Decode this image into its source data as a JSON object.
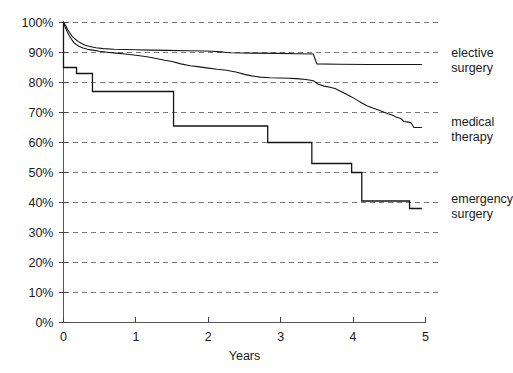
{
  "chart_data": {
    "type": "line",
    "title": "",
    "subtitle": "",
    "xlabel": "Years",
    "ylabel": "",
    "xlim": [
      0,
      5
    ],
    "ylim": [
      0,
      1.0
    ],
    "grid": true,
    "grid_axis": "y",
    "legend_position": "right-inline",
    "x_ticks": [
      "0",
      "1",
      "2",
      "3",
      "4",
      "5"
    ],
    "x_tick_values": [
      0,
      1,
      2,
      3,
      4,
      5
    ],
    "y_ticks": [
      "0%",
      "10%",
      "20%",
      "30%",
      "40%",
      "50%",
      "60%",
      "70%",
      "80%",
      "90%",
      "100%"
    ],
    "y_tick_values": [
      0,
      10,
      20,
      30,
      40,
      50,
      60,
      70,
      80,
      90,
      100
    ],
    "curve_style": "kaplan-meier step / survival",
    "series": [
      {
        "name": "elective surgery",
        "label_line1": "elective",
        "label_line2": "surgery",
        "color": "#151515",
        "label_x": 5.08,
        "label_y_pct": 88.5,
        "final_value_pct": 86,
        "points": [
          [
            0.0,
            100.0
          ],
          [
            0.03,
            99.0
          ],
          [
            0.06,
            97.6
          ],
          [
            0.09,
            96.4
          ],
          [
            0.12,
            95.4
          ],
          [
            0.16,
            94.5
          ],
          [
            0.2,
            93.7
          ],
          [
            0.25,
            93.0
          ],
          [
            0.3,
            92.4
          ],
          [
            0.36,
            92.0
          ],
          [
            0.45,
            91.6
          ],
          [
            0.55,
            91.3
          ],
          [
            0.7,
            91.1
          ],
          [
            0.85,
            91.0
          ],
          [
            1.0,
            90.9
          ],
          [
            1.2,
            90.8
          ],
          [
            1.45,
            90.7
          ],
          [
            1.7,
            90.6
          ],
          [
            1.95,
            90.5
          ],
          [
            2.05,
            90.4
          ],
          [
            2.12,
            90.3
          ],
          [
            2.18,
            90.2
          ],
          [
            2.22,
            90.1
          ],
          [
            2.25,
            90.0
          ],
          [
            2.3,
            89.9
          ],
          [
            2.6,
            89.8
          ],
          [
            2.95,
            89.7
          ],
          [
            3.25,
            89.6
          ],
          [
            3.45,
            89.5
          ],
          [
            3.5,
            86.2
          ],
          [
            3.8,
            86.1
          ],
          [
            4.2,
            86.0
          ],
          [
            4.6,
            86.0
          ],
          [
            4.95,
            86.0
          ]
        ]
      },
      {
        "name": "medical therapy",
        "label_line1": "medical",
        "label_line2": "therapy",
        "color": "#151515",
        "label_x": 5.08,
        "label_y_pct": 65.5,
        "final_value_pct": 65,
        "points": [
          [
            0.0,
            100.0
          ],
          [
            0.02,
            98.6
          ],
          [
            0.05,
            97.0
          ],
          [
            0.08,
            95.6
          ],
          [
            0.11,
            94.4
          ],
          [
            0.14,
            93.4
          ],
          [
            0.18,
            92.6
          ],
          [
            0.22,
            92.0
          ],
          [
            0.27,
            91.5
          ],
          [
            0.33,
            91.1
          ],
          [
            0.4,
            90.8
          ],
          [
            0.5,
            90.4
          ],
          [
            0.6,
            90.1
          ],
          [
            0.72,
            89.8
          ],
          [
            0.85,
            89.5
          ],
          [
            1.0,
            89.1
          ],
          [
            1.15,
            88.6
          ],
          [
            1.28,
            88.0
          ],
          [
            1.4,
            87.4
          ],
          [
            1.5,
            87.0
          ],
          [
            1.62,
            86.2
          ],
          [
            1.75,
            85.6
          ],
          [
            1.88,
            85.2
          ],
          [
            2.0,
            84.8
          ],
          [
            2.12,
            84.4
          ],
          [
            2.25,
            84.1
          ],
          [
            2.38,
            83.5
          ],
          [
            2.5,
            82.7
          ],
          [
            2.6,
            82.2
          ],
          [
            2.72,
            81.8
          ],
          [
            2.85,
            81.6
          ],
          [
            3.0,
            81.5
          ],
          [
            3.1,
            81.4
          ],
          [
            3.22,
            81.3
          ],
          [
            3.35,
            81.0
          ],
          [
            3.45,
            80.6
          ],
          [
            3.52,
            79.4
          ],
          [
            3.6,
            78.8
          ],
          [
            3.68,
            78.4
          ],
          [
            3.75,
            78.0
          ],
          [
            3.82,
            77.2
          ],
          [
            3.9,
            76.2
          ],
          [
            3.98,
            75.2
          ],
          [
            4.05,
            74.2
          ],
          [
            4.12,
            73.2
          ],
          [
            4.2,
            72.2
          ],
          [
            4.28,
            71.4
          ],
          [
            4.35,
            70.8
          ],
          [
            4.42,
            70.2
          ],
          [
            4.48,
            69.6
          ],
          [
            4.54,
            69.2
          ],
          [
            4.6,
            68.4
          ],
          [
            4.66,
            68.0
          ],
          [
            4.7,
            67.0
          ],
          [
            4.76,
            66.8
          ],
          [
            4.8,
            66.6
          ],
          [
            4.84,
            65.0
          ],
          [
            4.95,
            65.0
          ]
        ]
      },
      {
        "name": "emergency surgery",
        "label_line1": "emergency",
        "label_line2": "surgery",
        "color": "#151515",
        "label_x": 5.08,
        "label_y_pct": 40.0,
        "final_value_pct": 38,
        "step": true,
        "points": [
          [
            0.0,
            100.0
          ],
          [
            0.0,
            85.0
          ],
          [
            0.18,
            85.0
          ],
          [
            0.18,
            83.0
          ],
          [
            0.4,
            83.0
          ],
          [
            0.4,
            77.0
          ],
          [
            1.52,
            77.0
          ],
          [
            1.52,
            65.5
          ],
          [
            2.82,
            65.5
          ],
          [
            2.82,
            60.0
          ],
          [
            3.43,
            60.0
          ],
          [
            3.43,
            53.0
          ],
          [
            3.98,
            53.0
          ],
          [
            3.98,
            50.0
          ],
          [
            4.12,
            50.0
          ],
          [
            4.12,
            40.5
          ],
          [
            4.78,
            40.5
          ],
          [
            4.78,
            38.0
          ],
          [
            4.95,
            38.0
          ]
        ]
      }
    ]
  },
  "axes": {
    "x_axis_title": "Years",
    "y_axis_title": ""
  }
}
